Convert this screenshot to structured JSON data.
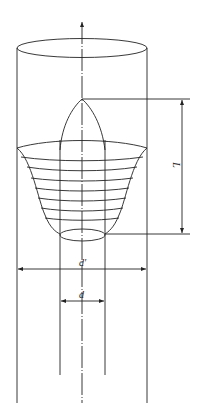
{
  "diagram": {
    "type": "engineering drawing",
    "line_color": "#222222",
    "background": "#ffffff"
  },
  "labels": {
    "length": "L",
    "outer_diameter": "d′",
    "inner_diameter": "d"
  },
  "dimensions": [
    {
      "name": "L",
      "orientation": "vertical",
      "description": "Length from dome apex to bulb bottom"
    },
    {
      "name": "d′",
      "orientation": "horizontal",
      "description": "Outer cylinder diameter"
    },
    {
      "name": "d",
      "orientation": "horizontal",
      "description": "Inner pipe diameter"
    }
  ]
}
